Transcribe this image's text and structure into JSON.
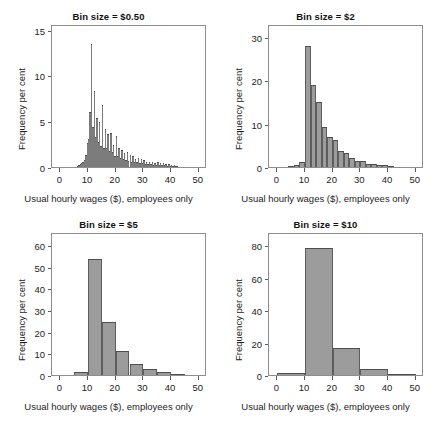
{
  "figure": {
    "shared_xlabel": "Usual hourly wages ($), employees only",
    "shared_ylabel": "Frequency per cent",
    "bar_fill": "#9c9c9c",
    "bar_edge": "#4e4e4e",
    "axis_color": "#8d8d8d",
    "background": "#ffffff"
  },
  "chart_data": [
    {
      "type": "bar",
      "title": "Bin size = $0.50",
      "xlabel": "Usual hourly wages ($), employees only",
      "ylabel": "Frequency per cent",
      "xlim": [
        -3,
        53
      ],
      "ylim": [
        0,
        15.6
      ],
      "xticks": [
        0,
        10,
        20,
        30,
        40,
        50
      ],
      "yticks": [
        0,
        5,
        10,
        15
      ],
      "grid": false,
      "legend": "none",
      "bin_size": 0.5,
      "bin_starts": [
        6.0,
        6.5,
        7.0,
        7.5,
        8.0,
        8.5,
        9.0,
        9.5,
        10.0,
        10.5,
        11.0,
        11.5,
        12.0,
        12.5,
        13.0,
        13.5,
        14.0,
        14.5,
        15.0,
        15.5,
        16.0,
        16.5,
        17.0,
        17.5,
        18.0,
        18.5,
        19.0,
        19.5,
        20.0,
        20.5,
        21.0,
        21.5,
        22.0,
        22.5,
        23.0,
        23.5,
        24.0,
        24.5,
        25.0,
        25.5,
        26.0,
        26.5,
        27.0,
        27.5,
        28.0,
        28.5,
        29.0,
        29.5,
        30.0,
        30.5,
        31.0,
        31.5,
        32.0,
        32.5,
        33.0,
        33.5,
        34.0,
        34.5,
        35.0,
        35.5,
        36.0,
        36.5,
        37.0,
        37.5,
        38.0,
        38.5,
        39.0,
        39.5,
        40.0,
        40.5,
        41.0,
        41.5,
        42.0
      ],
      "values": [
        0.15,
        0.2,
        0.3,
        0.4,
        0.5,
        0.8,
        1.3,
        2.6,
        3.1,
        6.0,
        13.4,
        4.4,
        8.3,
        3.3,
        5.4,
        2.7,
        4.9,
        2.3,
        6.8,
        2.1,
        4.1,
        2.1,
        3.6,
        1.8,
        3.7,
        1.6,
        2.4,
        1.2,
        3.4,
        1.2,
        2.1,
        1.0,
        1.9,
        0.9,
        1.5,
        0.8,
        1.6,
        0.7,
        1.3,
        0.6,
        1.2,
        0.5,
        0.9,
        0.5,
        1.0,
        0.4,
        0.9,
        0.4,
        0.8,
        0.35,
        0.6,
        0.3,
        0.55,
        0.3,
        0.5,
        0.25,
        0.45,
        0.25,
        0.5,
        0.2,
        0.45,
        0.2,
        0.4,
        0.2,
        0.35,
        0.15,
        0.3,
        0.12,
        0.25,
        0.1,
        0.2,
        0.08,
        0.12
      ]
    },
    {
      "type": "bar",
      "title": "Bin size = $2",
      "xlabel": "Usual hourly wages ($), employees only",
      "ylabel": "Frequency per cent",
      "xlim": [
        -3,
        53
      ],
      "ylim": [
        0,
        33
      ],
      "xticks": [
        0,
        10,
        20,
        30,
        40,
        50
      ],
      "yticks": [
        0,
        10,
        20,
        30
      ],
      "grid": false,
      "legend": "none",
      "bin_size": 2,
      "bin_starts": [
        4,
        6,
        8,
        10,
        12,
        14,
        16,
        18,
        20,
        22,
        24,
        26,
        28,
        30,
        32,
        34,
        36,
        38,
        40
      ],
      "values": [
        0.2,
        0.4,
        1.1,
        28.0,
        19.0,
        15.0,
        9.3,
        7.0,
        6.2,
        3.6,
        3.3,
        2.0,
        1.5,
        1.5,
        0.7,
        0.6,
        0.5,
        0.35,
        0.2
      ]
    },
    {
      "type": "bar",
      "title": "Bin size = $5",
      "xlabel": "Usual hourly wages ($), employees only",
      "ylabel": "Frequency per cent",
      "xlim": [
        -3,
        53
      ],
      "ylim": [
        0,
        66
      ],
      "xticks": [
        0,
        10,
        20,
        30,
        40,
        50
      ],
      "yticks": [
        0,
        10,
        20,
        30,
        40,
        50,
        60
      ],
      "grid": false,
      "legend": "none",
      "bin_size": 5,
      "bin_starts": [
        5,
        10,
        15,
        20,
        25,
        30,
        35,
        40
      ],
      "values": [
        1.2,
        53.5,
        24.5,
        11.0,
        5.2,
        2.6,
        1.3,
        0.3
      ]
    },
    {
      "type": "bar",
      "title": "Bin size = $10",
      "xlabel": "Usual hourly wages ($), employees only",
      "ylabel": "Frequency per cent",
      "xlim": [
        -3,
        53
      ],
      "ylim": [
        0,
        88
      ],
      "xticks": [
        0,
        10,
        20,
        30,
        40,
        50
      ],
      "yticks": [
        0,
        20,
        40,
        60,
        80
      ],
      "grid": false,
      "legend": "none",
      "bin_size": 10,
      "bin_starts": [
        0,
        10,
        20,
        30,
        40
      ],
      "values": [
        1.2,
        78.0,
        16.5,
        3.5,
        0.3
      ]
    }
  ]
}
